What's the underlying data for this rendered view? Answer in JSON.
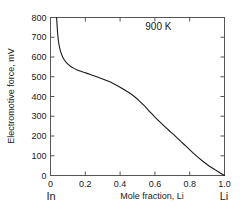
{
  "chart_data": {
    "type": "line",
    "title": "",
    "subtitle": "",
    "xlabel": "Mole fraction,  Li",
    "ylabel": "Electromotive force,  mV",
    "xlim": [
      0,
      1.0
    ],
    "ylim": [
      0,
      800
    ],
    "grid": false,
    "legend": null,
    "annotations": [
      {
        "text": "900 K",
        "x": 0.62,
        "y": 735
      }
    ],
    "axis_end_labels": {
      "left": "In",
      "right": "Li"
    },
    "xticks": [
      0,
      0.2,
      0.4,
      0.6,
      0.8,
      1.0
    ],
    "xticklabels": [
      "0",
      "0.2",
      "0.4",
      "0.6",
      "0.8",
      "1.0"
    ],
    "yticks": [
      0,
      100,
      200,
      300,
      400,
      500,
      600,
      700,
      800
    ],
    "yticklabels": [
      "0",
      "100",
      "200",
      "300",
      "400",
      "500",
      "600",
      "700",
      "800"
    ],
    "series": [
      {
        "name": "emf",
        "color": "#1a1a1a",
        "x": [
          0.035,
          0.038,
          0.042,
          0.047,
          0.053,
          0.06,
          0.07,
          0.08,
          0.09,
          0.1,
          0.115,
          0.13,
          0.15,
          0.17,
          0.19,
          0.21,
          0.24,
          0.27,
          0.3,
          0.33,
          0.36,
          0.39,
          0.42,
          0.45,
          0.48,
          0.51,
          0.54,
          0.57,
          0.6,
          0.63,
          0.66,
          0.69,
          0.72,
          0.75,
          0.78,
          0.81,
          0.84,
          0.87,
          0.9,
          0.93,
          0.955,
          0.975,
          0.99,
          1.0
        ],
        "y": [
          800,
          760,
          710,
          672,
          645,
          622,
          600,
          585,
          573,
          564,
          553,
          545,
          536,
          529,
          523,
          517,
          508,
          499,
          489,
          478,
          466,
          452,
          437,
          420,
          401,
          378,
          352,
          324,
          296,
          270,
          245,
          221,
          197,
          172,
          147,
          122,
          98,
          76,
          56,
          38,
          24,
          13,
          5,
          0
        ]
      }
    ]
  }
}
